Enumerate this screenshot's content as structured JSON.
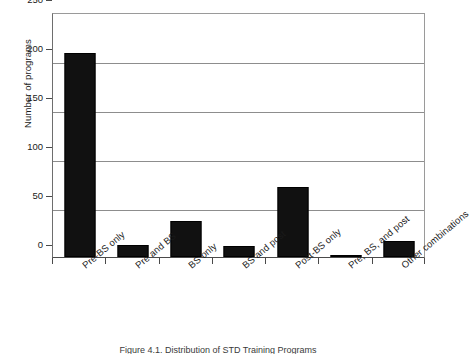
{
  "chart_data": {
    "type": "bar",
    "title": "",
    "xlabel": "",
    "ylabel": "Number of programs",
    "ylim": [
      0,
      250
    ],
    "yticks": [
      0,
      50,
      100,
      150,
      200,
      250
    ],
    "grid": true,
    "legend": "none",
    "orientation": "vertical",
    "bar_color": "#111111",
    "categories": [
      "Pre-BS only",
      "Pre and BS",
      "BS only",
      "BS and post",
      "Post-BS only",
      "Pre, BS, and post",
      "Other combinations"
    ],
    "values": [
      208,
      12,
      37,
      11,
      71,
      2,
      16
    ]
  },
  "axis": {
    "y_title": "Number of programs",
    "y_tick_labels": [
      "250",
      "200",
      "150",
      "100",
      "50",
      "0"
    ]
  },
  "caption": {
    "text": "Figure 4.1. Distribution of STD Training Programs"
  }
}
